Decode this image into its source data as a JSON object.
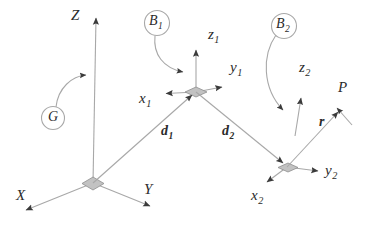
{
  "figure": {
    "kind": "kinematic-reference-frame-diagram",
    "background_color": "#ffffff",
    "line_color": "#9a9a9a",
    "text_color": "#2b2b2b",
    "marker_fill": "#bdbdbd",
    "arrowhead_color": "#3a3a3a"
  },
  "global_frame": {
    "label": "G",
    "origin": {
      "x": 93,
      "y": 183
    },
    "axes": [
      {
        "name": "Z",
        "label": "Z",
        "sub": "",
        "label_x": 71,
        "label_y": 10,
        "tip_x": 96,
        "tip_y": 13
      },
      {
        "name": "X",
        "label": "X",
        "sub": "",
        "label_x": 16,
        "label_y": 190,
        "tip_x": 22,
        "tip_y": 214
      },
      {
        "name": "Y",
        "label": "Y",
        "sub": "",
        "label_x": 144,
        "label_y": 184,
        "tip_x": 154,
        "tip_y": 210
      }
    ]
  },
  "body_frames": [
    {
      "name": "body-1",
      "label": "B",
      "sub": "1",
      "bubble_x": 157,
      "bubble_y": 23,
      "origin": {
        "x": 196,
        "y": 92
      },
      "axes": [
        {
          "name": "z1",
          "label": "z",
          "sub": "1",
          "label_x": 208,
          "label_y": 29,
          "tip_x": 196,
          "tip_y": 46
        },
        {
          "name": "y1",
          "label": "y",
          "sub": "1",
          "label_x": 230,
          "label_y": 62,
          "tip_x": 226,
          "tip_y": 88
        },
        {
          "name": "x1",
          "label": "x",
          "sub": "1",
          "label_x": 141,
          "label_y": 93,
          "tip_x": 161,
          "tip_y": 94
        }
      ]
    },
    {
      "name": "body-2",
      "label": "B",
      "sub": "2",
      "bubble_x": 284,
      "bubble_y": 26,
      "origin": {
        "x": 287,
        "y": 167
      },
      "axes": [
        {
          "name": "z2",
          "label": "z",
          "sub": "2",
          "label_x": 300,
          "label_y": 62,
          "tip_x": 301,
          "tip_y": 93
        },
        {
          "name": "y2",
          "label": "y",
          "sub": "2",
          "label_x": 330,
          "label_y": 166,
          "tip_x": 322,
          "tip_y": 172
        },
        {
          "name": "x2",
          "label": "x",
          "sub": "2",
          "label_x": 252,
          "label_y": 189,
          "tip_x": 263,
          "tip_y": 184
        }
      ]
    }
  ],
  "vectors": [
    {
      "name": "d1",
      "label": "d",
      "sub": "1",
      "label_x": 161,
      "label_y": 126,
      "from": {
        "x": 93,
        "y": 183
      },
      "to": {
        "x": 196,
        "y": 92
      }
    },
    {
      "name": "d2",
      "label": "d",
      "sub": "2",
      "label_x": 222,
      "label_y": 126,
      "from": {
        "x": 196,
        "y": 92
      },
      "to": {
        "x": 287,
        "y": 167
      }
    },
    {
      "name": "r",
      "label": "r",
      "sub": "",
      "label_x": 318,
      "label_y": 117,
      "from": {
        "x": 287,
        "y": 167
      },
      "to": {
        "x": 340,
        "y": 108
      }
    }
  ],
  "points": [
    {
      "name": "point-P",
      "label": "P",
      "sub": "",
      "label_x": 338,
      "label_y": 82
    }
  ],
  "callout_arcs": [
    {
      "name": "arc-G-to-Z-axis",
      "from_bubble": "G",
      "to": "Z-axis"
    },
    {
      "name": "arc-B1-to-origin1",
      "from_bubble": "B1",
      "to": "frame-1-origin"
    },
    {
      "name": "arc-B2-to-origin2",
      "from_bubble": "B2",
      "to": "frame-2-origin"
    }
  ]
}
